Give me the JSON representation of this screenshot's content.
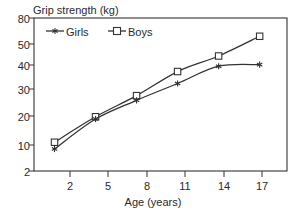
{
  "chart_data": {
    "type": "line",
    "title": "",
    "ylabel": "Grip strength (kg)",
    "xlabel": "Age (years)",
    "x": [
      2,
      5,
      8,
      11,
      14,
      17
    ],
    "xtick_labels": [
      "2",
      "5",
      "8",
      "11",
      "14",
      "17"
    ],
    "ytick_labels": [
      "80",
      "50",
      "40",
      "30",
      "20",
      "10",
      "2"
    ],
    "ytick_values": [
      80,
      50,
      40,
      30,
      20,
      10,
      2
    ],
    "yscale": "log",
    "ylim": [
      2,
      80
    ],
    "xlim": [
      0.5,
      19
    ],
    "grid": false,
    "legend_position": "top-left-inside",
    "series": [
      {
        "name": "Girls",
        "marker": "star",
        "values": [
          3.4,
          7.0,
          11.0,
          16.5,
          25.0,
          26.0
        ]
      },
      {
        "name": "Boys",
        "marker": "open-square",
        "values": [
          4.0,
          7.4,
          12.3,
          22.0,
          32.0,
          51.5
        ]
      }
    ]
  },
  "legend": {
    "girls_label": "Girls",
    "boys_label": "Boys"
  },
  "colors": {
    "line": "#333333",
    "axis": "#333333",
    "text": "#2a2a2a",
    "background": "#ffffff"
  }
}
